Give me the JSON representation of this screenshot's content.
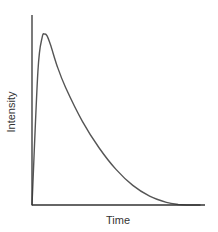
{
  "chart_data": {
    "type": "line",
    "title": "",
    "xlabel": "Time",
    "ylabel": "Intensity",
    "grid": false,
    "legend": null,
    "ticks": {
      "x": [],
      "y": []
    },
    "xlim": [
      0,
      1
    ],
    "ylim": [
      0,
      1
    ],
    "series": [
      {
        "name": "Intensity",
        "color": "#555555",
        "x": [
          0.0,
          0.035,
          0.06,
          0.075,
          0.09,
          0.11,
          0.15,
          0.2,
          0.3,
          0.4,
          0.5,
          0.6,
          0.7,
          0.8,
          0.87,
          0.93,
          1.0
        ],
        "y": [
          0.0,
          0.75,
          0.94,
          0.96,
          0.95,
          0.9,
          0.78,
          0.66,
          0.47,
          0.32,
          0.2,
          0.11,
          0.05,
          0.015,
          0.003,
          0.0,
          0.0
        ]
      }
    ]
  },
  "colors": {
    "axis": "#333333",
    "curve": "#555555",
    "background": "#ffffff"
  }
}
